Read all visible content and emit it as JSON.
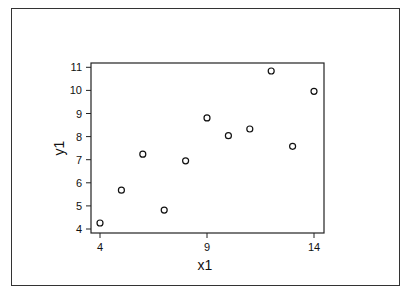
{
  "chart_data": {
    "type": "scatter",
    "title": "",
    "xlabel": "x1",
    "ylabel": "y1",
    "xlim": [
      3.6,
      14.5
    ],
    "ylim": [
      3.9,
      11.2
    ],
    "xticks": [
      4,
      9,
      14
    ],
    "yticks": [
      4,
      5,
      6,
      7,
      8,
      9,
      10,
      11
    ],
    "grid": false,
    "legend": null,
    "marker": "open-circle",
    "series": [
      {
        "name": "y1",
        "x": [
          4,
          5,
          6,
          7,
          8,
          9,
          10,
          11,
          12,
          13,
          14
        ],
        "y": [
          4.26,
          5.68,
          7.24,
          4.82,
          6.95,
          8.81,
          8.04,
          8.33,
          10.84,
          7.58,
          9.96
        ]
      }
    ]
  }
}
